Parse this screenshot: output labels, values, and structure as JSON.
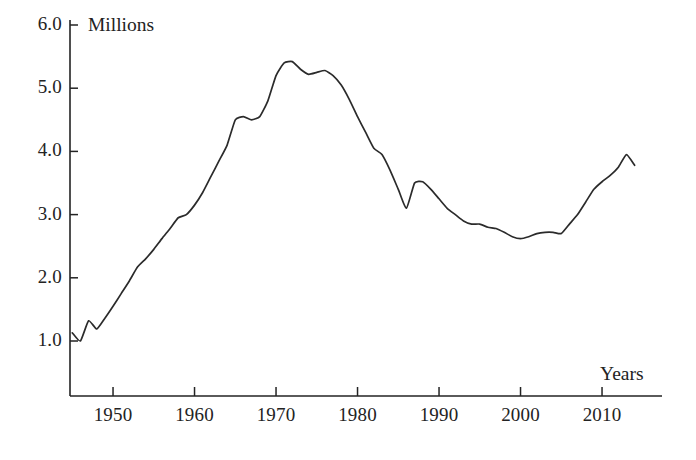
{
  "chart_data": {
    "type": "line",
    "title": "",
    "subtitle": "",
    "xlabel": "Years",
    "ylabel": "Millions",
    "xlim": [
      1944.5,
      2016
    ],
    "ylim": [
      0.0,
      6.4
    ],
    "grid": false,
    "legend": null,
    "annotations": [],
    "xticks": [
      1950,
      1960,
      1970,
      1980,
      1990,
      2000,
      2010
    ],
    "xtick_labels": [
      "1950",
      "1960",
      "1970",
      "1980",
      "1990",
      "2000",
      "2010"
    ],
    "yticks": [
      1.0,
      2.0,
      3.0,
      4.0,
      5.0,
      6.0
    ],
    "ytick_labels": [
      "1.0",
      "2.0",
      "3.0",
      "4.0",
      "5.0",
      "6.0"
    ],
    "series": [
      {
        "name": "Value",
        "units": "Millions",
        "x": [
          1945,
          1946,
          1947,
          1948,
          1949,
          1950,
          1951,
          1952,
          1953,
          1954,
          1955,
          1956,
          1957,
          1958,
          1959,
          1960,
          1961,
          1962,
          1963,
          1964,
          1965,
          1966,
          1967,
          1968,
          1969,
          1970,
          1971,
          1972,
          1973,
          1974,
          1975,
          1976,
          1977,
          1978,
          1979,
          1980,
          1981,
          1982,
          1983,
          1984,
          1985,
          1986,
          1987,
          1988,
          1989,
          1990,
          1991,
          1992,
          1993,
          1994,
          1995,
          1996,
          1997,
          1998,
          1999,
          2000,
          2001,
          2002,
          2003,
          2004,
          2005,
          2006,
          2007,
          2008,
          2009,
          2010,
          2011,
          2012,
          2013,
          2014
        ],
        "y": [
          1.13,
          1.0,
          1.32,
          1.19,
          1.36,
          1.55,
          1.75,
          1.95,
          2.17,
          2.3,
          2.45,
          2.62,
          2.78,
          2.95,
          3.0,
          3.15,
          3.35,
          3.6,
          3.85,
          4.1,
          4.5,
          4.55,
          4.5,
          4.55,
          4.8,
          5.2,
          5.4,
          5.42,
          5.3,
          5.22,
          5.25,
          5.28,
          5.2,
          5.05,
          4.82,
          4.55,
          4.3,
          4.05,
          3.95,
          3.7,
          3.4,
          3.1,
          3.5,
          3.52,
          3.4,
          3.25,
          3.1,
          3.0,
          2.9,
          2.85,
          2.85,
          2.8,
          2.78,
          2.72,
          2.65,
          2.62,
          2.65,
          2.7,
          2.72,
          2.72,
          2.7,
          2.85,
          3.0,
          3.2,
          3.4,
          3.52,
          3.62,
          3.75,
          3.95,
          3.78
        ]
      }
    ]
  },
  "axes": {
    "y_axis_title": "Millions",
    "x_axis_title": "Years"
  },
  "style": {
    "line_color": "#2b2b2b",
    "axis_color": "#232323",
    "background": "#ffffff"
  }
}
